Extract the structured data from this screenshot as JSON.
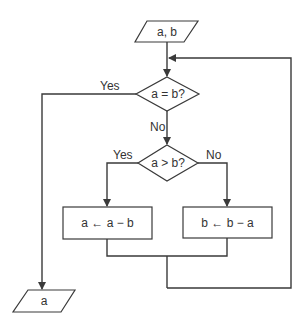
{
  "diagram": {
    "type": "flowchart",
    "nodes": {
      "input": {
        "shape": "parallelogram",
        "label": "a, b"
      },
      "decision_equal": {
        "shape": "diamond",
        "label": "a = b?"
      },
      "decision_greater": {
        "shape": "diamond",
        "label": "a > b?"
      },
      "process_a": {
        "shape": "rectangle",
        "label": "a ← a − b"
      },
      "process_b": {
        "shape": "rectangle",
        "label": "b ← b − a"
      },
      "output": {
        "shape": "parallelogram",
        "label": "a"
      }
    },
    "edge_labels": {
      "equal_yes": "Yes",
      "equal_no": "No",
      "greater_yes": "Yes",
      "greater_no": "No"
    },
    "colors": {
      "stroke": "#3a3a3a",
      "text": "#333333",
      "background": "#ffffff"
    }
  }
}
